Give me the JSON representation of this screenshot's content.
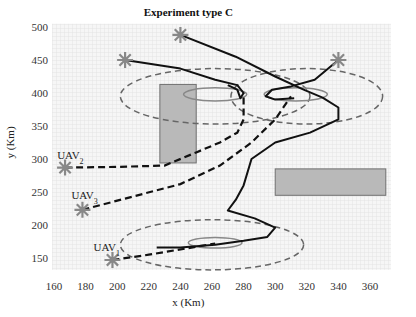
{
  "chart_data": {
    "type": "scatter",
    "title": "Experiment type C",
    "xlabel": "x (Km)",
    "ylabel": "y (Km)",
    "xlim": [
      160,
      372
    ],
    "ylim": [
      132,
      505
    ],
    "xticks": [
      160,
      180,
      200,
      220,
      240,
      260,
      280,
      300,
      320,
      340,
      360
    ],
    "yticks": [
      150,
      200,
      250,
      300,
      350,
      400,
      450,
      500
    ],
    "grid": false,
    "uavs": [
      {
        "name": "UAV",
        "sub": "1",
        "start": [
          197,
          147
        ],
        "label_pos": [
          185,
          160
        ]
      },
      {
        "name": "UAV",
        "sub": "2",
        "start": [
          167,
          287
        ],
        "label_pos": [
          162,
          300
        ]
      },
      {
        "name": "UAV",
        "sub": "3",
        "start": [
          178,
          223
        ],
        "label_pos": [
          171,
          240
        ]
      }
    ],
    "targets": [
      [
        205,
        450
      ],
      [
        240,
        488
      ],
      [
        340,
        450
      ]
    ],
    "obstacles": [
      {
        "x": [
          227,
          250
        ],
        "y": [
          294,
          413
        ]
      },
      {
        "x": [
          300,
          370
        ],
        "y": [
          245,
          285
        ]
      }
    ],
    "dashed_ellipses": [
      {
        "cx": 262,
        "cy": 395,
        "rx": 60,
        "ry": 42
      },
      {
        "cx": 320,
        "cy": 395,
        "rx": 48,
        "ry": 42
      },
      {
        "cx": 260,
        "cy": 170,
        "rx": 58,
        "ry": 38
      }
    ],
    "solid_ellipses": [
      {
        "cx": 262,
        "cy": 398,
        "rx": 20,
        "ry": 10
      },
      {
        "cx": 313,
        "cy": 398,
        "rx": 20,
        "ry": 10
      },
      {
        "cx": 262,
        "cy": 173,
        "rx": 17,
        "ry": 8
      }
    ],
    "solid_paths": [
      [
        [
          205,
          450
        ],
        [
          240,
          437
        ],
        [
          262,
          420
        ],
        [
          276,
          412
        ],
        [
          280,
          400
        ],
        [
          278,
          392
        ],
        [
          276,
          405
        ],
        [
          270,
          412
        ]
      ],
      [
        [
          240,
          488
        ],
        [
          275,
          455
        ],
        [
          300,
          425
        ],
        [
          318,
          405
        ],
        [
          330,
          393
        ],
        [
          340,
          378
        ],
        [
          340,
          360
        ],
        [
          322,
          340
        ],
        [
          300,
          325
        ],
        [
          285,
          300
        ],
        [
          280,
          260
        ],
        [
          275,
          238
        ],
        [
          270,
          222
        ],
        [
          287,
          210
        ],
        [
          300,
          196
        ],
        [
          295,
          182
        ],
        [
          280,
          176
        ],
        [
          262,
          170
        ],
        [
          240,
          166
        ],
        [
          225,
          166
        ]
      ],
      [
        [
          340,
          450
        ],
        [
          325,
          420
        ],
        [
          310,
          410
        ],
        [
          298,
          405
        ],
        [
          294,
          395
        ],
        [
          300,
          390
        ],
        [
          312,
          392
        ]
      ]
    ],
    "dashed_paths": [
      [
        [
          167,
          287
        ],
        [
          200,
          288
        ],
        [
          230,
          290
        ],
        [
          250,
          310
        ],
        [
          265,
          325
        ],
        [
          276,
          340
        ],
        [
          280,
          360
        ],
        [
          280,
          400
        ]
      ],
      [
        [
          178,
          223
        ],
        [
          205,
          240
        ],
        [
          240,
          262
        ],
        [
          265,
          290
        ],
        [
          285,
          325
        ],
        [
          300,
          360
        ],
        [
          310,
          395
        ]
      ],
      [
        [
          197,
          147
        ],
        [
          220,
          155
        ],
        [
          245,
          165
        ],
        [
          262,
          172
        ]
      ]
    ],
    "colors": {
      "star": "#888888",
      "obstacle_fill": "#b9b9b9",
      "obstacle_stroke": "#707070",
      "dashed_ellipse": "#666666",
      "solid_ellipse": "#888888",
      "path": "#111111",
      "texture": "#d0d0d0"
    }
  }
}
